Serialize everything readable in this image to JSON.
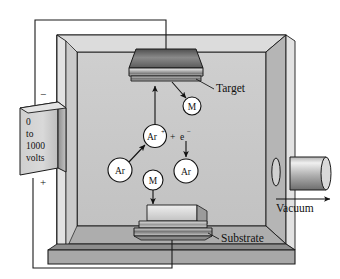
{
  "diagram": {
    "power_supply": {
      "name": "power-supply",
      "lines": [
        "0",
        "to",
        "1000",
        "volts"
      ],
      "text": "0 to 1000 volts",
      "negative_terminal": "−",
      "positive_terminal": "+"
    },
    "labels": {
      "target": "Target",
      "substrate": "Substrate",
      "vacuum": "Vacuum"
    },
    "particles": [
      {
        "id": "m-upper",
        "label": "M",
        "sup": ""
      },
      {
        "id": "ar-ion",
        "label": "Ar",
        "sup": "+"
      },
      {
        "id": "ar-neutral",
        "label": "Ar",
        "sup": ""
      },
      {
        "id": "ar-right",
        "label": "Ar",
        "sup": ""
      },
      {
        "id": "m-lower",
        "label": "M",
        "sup": ""
      }
    ],
    "reaction": {
      "plus": "+",
      "electron": "e",
      "electron_sup": "−"
    },
    "colors": {
      "chamber_interior": "#c9c9c9",
      "chamber_frame": "#8f8f8f",
      "chamber_wall_light": "#dcdcdc",
      "metal_light": "#e8e8e8",
      "metal_dark": "#6e6e6e",
      "outline": "#1a1a1a",
      "particle_fill": "#ffffff",
      "wire": "#1a1a1a"
    }
  }
}
